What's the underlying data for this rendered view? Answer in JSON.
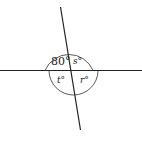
{
  "diagram": {
    "type": "intersecting-lines-angles",
    "angles": {
      "top_left": {
        "label": "80°",
        "value": 80
      },
      "top_right": {
        "label": "s°",
        "variable": "s"
      },
      "bottom_left": {
        "label": "t°",
        "variable": "t"
      },
      "bottom_right": {
        "label": "r°",
        "variable": "r"
      }
    }
  }
}
